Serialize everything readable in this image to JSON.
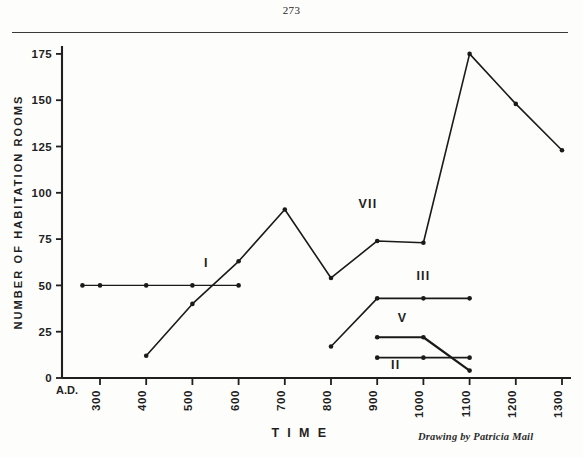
{
  "page": {
    "page_number": "273",
    "credit": "Drawing by Patricia Mail"
  },
  "chart_data": {
    "type": "line",
    "title": "",
    "xlabel": "T I M E",
    "ylabel": "NUMBER OF HABITATION ROOMS",
    "x_origin_label": "A.D.",
    "xlim": [
      250,
      1350
    ],
    "ylim": [
      0,
      180
    ],
    "grid": false,
    "legend_position": "inline-annotations",
    "xticks": [
      300,
      400,
      500,
      600,
      700,
      800,
      900,
      1000,
      1100,
      1200,
      1300
    ],
    "xtick_labels": [
      "300",
      "400",
      "500",
      "600",
      "700",
      "800",
      "900",
      "1000",
      "1100",
      "1200",
      "1300"
    ],
    "yticks": [
      0,
      25,
      50,
      75,
      100,
      125,
      150,
      175
    ],
    "ytick_labels": [
      "0",
      "25",
      "50",
      "75",
      "100",
      "125",
      "150",
      "175"
    ],
    "series": [
      {
        "name": "I",
        "label": "I",
        "label_x": 530,
        "label_y": 60,
        "color": "#1a1a1a",
        "width": 1.4,
        "markers": true,
        "x": [
          262,
          300,
          400,
          500,
          600
        ],
        "y": [
          50,
          50,
          50,
          50,
          50
        ]
      },
      {
        "name": "VII",
        "label": "VII",
        "label_x": 880,
        "label_y": 92,
        "color": "#1a1a1a",
        "width": 1.6,
        "markers": true,
        "x": [
          400,
          500,
          600,
          700,
          800,
          900,
          1000,
          1100,
          1200,
          1300
        ],
        "y": [
          12,
          40,
          63,
          91,
          54,
          74,
          73,
          175,
          148,
          123
        ]
      },
      {
        "name": "III",
        "label": "III",
        "label_x": 1000,
        "label_y": 53,
        "color": "#1a1a1a",
        "width": 1.6,
        "markers": true,
        "x": [
          800,
          900,
          1000,
          1100
        ],
        "y": [
          17,
          43,
          43,
          43
        ]
      },
      {
        "name": "V",
        "label": "V",
        "label_x": 955,
        "label_y": 30,
        "color": "#1a1a1a",
        "width": 2.2,
        "markers": true,
        "x": [
          900,
          1000,
          1100
        ],
        "y": [
          22,
          22,
          4
        ]
      },
      {
        "name": "II",
        "label": "II",
        "label_x": 940,
        "label_y": 5,
        "color": "#1a1a1a",
        "width": 1.6,
        "markers": true,
        "x": [
          900,
          1000,
          1100
        ],
        "y": [
          11,
          11,
          11
        ]
      }
    ],
    "annotations": [
      {
        "text": "I",
        "x": 530,
        "y": 60
      },
      {
        "text": "VII",
        "x": 880,
        "y": 92
      },
      {
        "text": "III",
        "x": 1000,
        "y": 53
      },
      {
        "text": "V",
        "x": 955,
        "y": 30
      },
      {
        "text": "II",
        "x": 940,
        "y": 5
      }
    ]
  }
}
